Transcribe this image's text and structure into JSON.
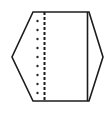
{
  "canvas": {
    "width": 106,
    "height": 125,
    "background_color": "#ffffff"
  },
  "figure": {
    "name": "hexagonal-gusset-plate-diagram",
    "stroke_color": "#1c1c1c",
    "fill_color": "#ffffff",
    "dot_color": "#2a2a2a",
    "dashed_line_color": "#1c1c1c"
  },
  "chart_data": {
    "type": "diagram",
    "title": "",
    "xlabel": "",
    "ylabel": "",
    "shapes": [
      {
        "name": "hexagon-outline",
        "type": "polygon",
        "stroke": "#1c1c1c",
        "fill": "#ffffff",
        "stroke_width": 1.6,
        "points": [
          [
            33,
            12
          ],
          [
            89,
            12
          ],
          [
            103,
            57
          ],
          [
            89,
            101
          ],
          [
            33,
            101
          ],
          [
            12,
            57
          ]
        ]
      },
      {
        "name": "right-vertical-solid-line",
        "type": "line",
        "stroke": "#1c1c1c",
        "stroke_width": 1.6,
        "x1": 87.5,
        "y1": 12,
        "x2": 87.5,
        "y2": 101
      },
      {
        "name": "left-vertical-dashed-line",
        "type": "line",
        "stroke": "#1c1c1c",
        "stroke_width": 2.0,
        "dash": "3 2",
        "x1": 44.5,
        "y1": 12,
        "x2": 44.5,
        "y2": 101
      },
      {
        "name": "rivet-dot-column",
        "type": "dots",
        "fill": "#2a2a2a",
        "radius": 1.2,
        "x": 37.5,
        "y_values": [
          21,
          30,
          39,
          48,
          57,
          66,
          75,
          84,
          93
        ]
      }
    ],
    "grid": false,
    "legend": null
  }
}
